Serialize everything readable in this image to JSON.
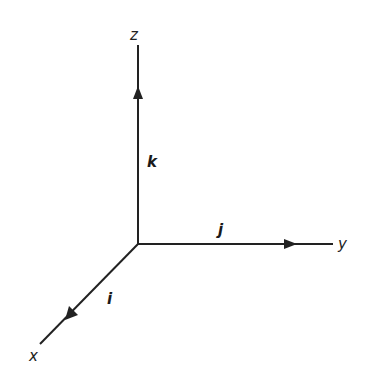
{
  "diagram": {
    "title": "",
    "type": "3D Cartesian coordinate axes with unit vectors",
    "colors": {
      "stroke": "#222222",
      "background": "#ffffff"
    },
    "origin": {
      "x": 138,
      "y": 244
    },
    "axes": [
      {
        "id": "z",
        "label": "z",
        "unit_vector_label": "k",
        "end": {
          "x": 138,
          "y": 45
        },
        "label_pos": {
          "x": 134,
          "y": 40
        },
        "arrow_tip": {
          "x": 138,
          "y": 86
        },
        "vector_label_pos": {
          "x": 149,
          "y": 166
        }
      },
      {
        "id": "y",
        "label": "y",
        "unit_vector_label": "j",
        "end": {
          "x": 333,
          "y": 244
        },
        "label_pos": {
          "x": 340,
          "y": 249
        },
        "arrow_tip": {
          "x": 297,
          "y": 244
        },
        "vector_label_pos": {
          "x": 221,
          "y": 234
        }
      },
      {
        "id": "x",
        "label": "x",
        "unit_vector_label": "i",
        "end": {
          "x": 40,
          "y": 344
        },
        "label_pos": {
          "x": 30,
          "y": 360
        },
        "arrow_tip": {
          "x": 66,
          "y": 320
        },
        "vector_label_pos": {
          "x": 108,
          "y": 303
        }
      }
    ]
  }
}
